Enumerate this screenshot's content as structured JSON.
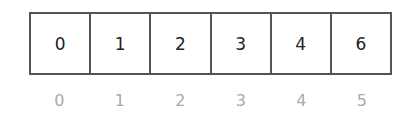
{
  "array": {
    "values": [
      "0",
      "1",
      "2",
      "3",
      "4",
      "6"
    ],
    "indices": [
      "0",
      "1",
      "2",
      "3",
      "4",
      "5"
    ]
  },
  "colors": {
    "border": "#555555",
    "value_text": "#222222",
    "index_text": "#aaaaaa"
  }
}
